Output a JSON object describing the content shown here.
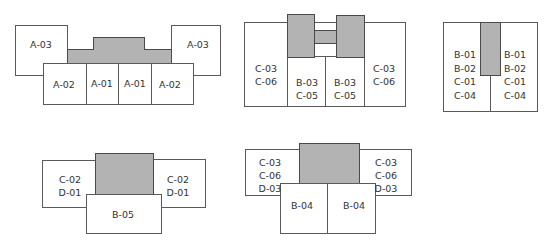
{
  "colors": {
    "fill": "#b3b3b3",
    "stroke": "#5a5a5a",
    "background": "#ffffff",
    "text": "#333333"
  },
  "groups": [
    {
      "id": "group-1",
      "labels": {
        "left_outer": "A-03",
        "right_outer": "A-03",
        "cells": [
          "A-02",
          "A-01",
          "A-01",
          "A-02"
        ]
      }
    },
    {
      "id": "group-2",
      "labels": {
        "left_outer": [
          "C-03",
          "C-06"
        ],
        "right_outer": [
          "C-03",
          "C-06"
        ],
        "cells": [
          [
            "B-03",
            "C-05"
          ],
          [
            "B-03",
            "C-05"
          ]
        ]
      }
    },
    {
      "id": "group-3",
      "labels": {
        "left": [
          "B-01",
          "B-02",
          "C-01",
          "C-04"
        ],
        "right": [
          "B-01",
          "B-02",
          "C-01",
          "C-04"
        ]
      }
    },
    {
      "id": "group-4",
      "labels": {
        "left_outer": [
          "C-02",
          "D-01"
        ],
        "right_outer": [
          "C-02",
          "D-01"
        ],
        "bottom": "B-05"
      }
    },
    {
      "id": "group-5",
      "labels": {
        "left_outer": [
          "C-03",
          "C-06",
          "D-03"
        ],
        "right_outer": [
          "C-03",
          "C-06",
          "D-03"
        ],
        "cells": [
          "B-04",
          "B-04"
        ]
      }
    }
  ],
  "text": {
    "g1_l": "A-03",
    "g1_r": "A-03",
    "g1_c1": "A-02",
    "g1_c2": "A-01",
    "g1_c3": "A-01",
    "g1_c4": "A-02",
    "g2_l": "C-03\nC-06",
    "g2_r": "C-03\nC-06",
    "g2_c1": "B-03\nC-05",
    "g2_c2": "B-03\nC-05",
    "g3_l": "B-01\nB-02\nC-01\nC-04",
    "g3_r": "B-01\nB-02\nC-01\nC-04",
    "g4_l": "C-02\nD-01",
    "g4_r": "C-02\nD-01",
    "g4_b": "B-05",
    "g5_l": "C-03\nC-06\nD-03",
    "g5_r": "C-03\nC-06\nD-03",
    "g5_c1": "B-04",
    "g5_c2": "B-04"
  }
}
